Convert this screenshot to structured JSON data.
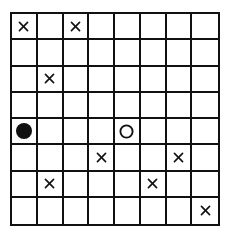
{
  "board": {
    "rows": 8,
    "cols": 8,
    "line_color": "#111111",
    "mark_color": "#111111",
    "pieces": [
      {
        "row": 0,
        "col": 0,
        "type": "cross"
      },
      {
        "row": 0,
        "col": 2,
        "type": "cross"
      },
      {
        "row": 2,
        "col": 1,
        "type": "cross"
      },
      {
        "row": 4,
        "col": 0,
        "type": "filled-circle"
      },
      {
        "row": 4,
        "col": 4,
        "type": "open-circle"
      },
      {
        "row": 5,
        "col": 3,
        "type": "cross"
      },
      {
        "row": 5,
        "col": 6,
        "type": "cross"
      },
      {
        "row": 6,
        "col": 1,
        "type": "cross"
      },
      {
        "row": 6,
        "col": 5,
        "type": "cross"
      },
      {
        "row": 7,
        "col": 7,
        "type": "cross"
      }
    ]
  }
}
